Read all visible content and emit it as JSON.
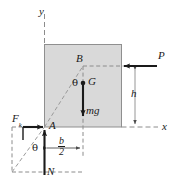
{
  "figure": {
    "type": "mechanics-free-body-diagram",
    "width": 172,
    "height": 191,
    "colors": {
      "block_fill": "#d9d9d9",
      "block_stroke": "#8c8c8c",
      "line": "#1a1a1a",
      "dashed": "#8c8c8c",
      "background": "#ffffff"
    }
  },
  "axes": {
    "y_label": "y",
    "x_label": "x"
  },
  "points": {
    "A": "A",
    "B": "B",
    "G": "G"
  },
  "forces": [
    {
      "name": "applied-force-P",
      "label": "P",
      "direction": "left",
      "applied_at": "right face of block at height h"
    },
    {
      "name": "weight-mg",
      "label": "mg",
      "direction": "down",
      "applied_at": "center of gravity G"
    },
    {
      "name": "friction-force-Fk",
      "label": "F",
      "subscript": "k",
      "direction": "right",
      "applied_at": "corner A"
    },
    {
      "name": "normal-force-N",
      "label": "N",
      "direction": "up",
      "applied_at": "corner A"
    }
  ],
  "dimensions": [
    {
      "name": "height-h",
      "label": "h",
      "orientation": "vertical",
      "description": "height of P above the x axis"
    },
    {
      "name": "half-width-b-over-2",
      "numerator": "b",
      "denominator": "2",
      "orientation": "horizontal",
      "description": "half width of block"
    }
  ],
  "angles": [
    {
      "name": "angle-theta-at-G",
      "label": "θ",
      "location": "between AB diagonal and vertical through G"
    },
    {
      "name": "angle-theta-at-A",
      "label": "θ",
      "location": "between diagonal and vertical at corner A"
    }
  ]
}
